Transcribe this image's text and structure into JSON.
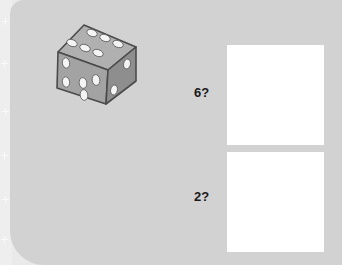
{
  "scene": {
    "background_color": "#eaeaea",
    "panel_color": "#d2d2d2",
    "left_strip_color": "#eeeeee",
    "sparkle_icon_name": "sparkle-icon",
    "sparkle_count": 6
  },
  "dice": {
    "icon_name": "die-icon",
    "body_color": "#9e9e9e",
    "top_face_color": "#adadad",
    "left_face_color": "#a5a5a5",
    "right_face_color": "#8c8c8c",
    "pip_color": "#f2f2f2",
    "outline_color": "#4c4c4c",
    "top_face_pips": 6,
    "left_face_pips": 5,
    "right_face_pips": 2,
    "alt_text": "A grey six-sided die showing 6 on the top face, 5 on the left face and 2 on the right face"
  },
  "questions": [
    {
      "label": "6?",
      "answer_value": "",
      "answer_placeholder": ""
    },
    {
      "label": "2?",
      "answer_value": "",
      "answer_placeholder": ""
    }
  ]
}
